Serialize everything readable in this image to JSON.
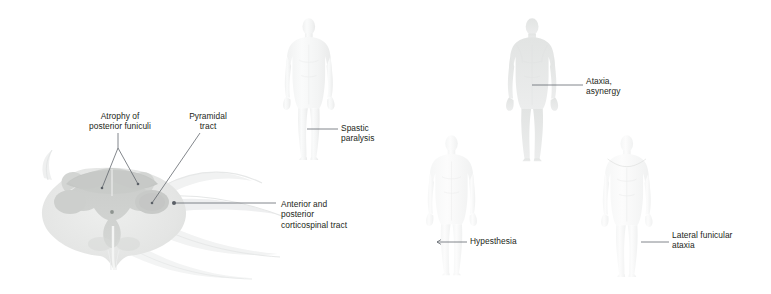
{
  "figure": {
    "background_color": "#ffffff",
    "text_color": "#231f20",
    "leader_color": "#5a5f66"
  },
  "cord_diagram": {
    "name": "spinal-cord-cross-section",
    "colors": {
      "outer_white_matter": "#e3e4e3",
      "gray_matter": "#cfd1cf",
      "posterior_funiculi": "#c6c8c6",
      "lateral_funiculus_patch": "#c9cbc9",
      "swoosh": "#eceded",
      "central_canal": "#8e9490"
    },
    "labels": [
      {
        "id": "atrophy-posterior-funiculi",
        "text": "Atrophy of\nposterior funiculi",
        "align": "center",
        "x": 70,
        "y": 111,
        "width": 100
      },
      {
        "id": "pyramidal-tract",
        "text": "Pyramidal\ntract",
        "align": "center",
        "x": 174,
        "y": 111,
        "width": 68
      },
      {
        "id": "anterior-posterior-corticospinal-tract",
        "text": "Anterior and\nposterior\ncorticospinal tract",
        "align": "left",
        "x": 281,
        "y": 199,
        "width": 96
      }
    ]
  },
  "body_figures": [
    {
      "id": "figure-spastic-paralysis",
      "shading": "lower-limbs",
      "label": {
        "id": "spastic-paralysis",
        "text": "Spastic\nparalysis",
        "align": "left",
        "x": 341,
        "y": 123,
        "width": 62
      }
    },
    {
      "id": "figure-ataxia-asynergy",
      "shading": "whole-body-light",
      "label": {
        "id": "ataxia-asynergy",
        "text": "Ataxia,\nasynergy",
        "align": "left",
        "x": 586,
        "y": 76,
        "width": 62
      }
    },
    {
      "id": "figure-hypesthesia",
      "shading": "whole-body-very-light",
      "label": {
        "id": "hypesthesia",
        "text": "Hypesthesia",
        "align": "left",
        "x": 470,
        "y": 235,
        "width": 80
      }
    },
    {
      "id": "figure-lateral-funicular-ataxia",
      "shading": "below-shoulder-cape",
      "label": {
        "id": "lateral-funicular-ataxia",
        "text": "Lateral funicular\nataxia",
        "align": "left",
        "x": 672,
        "y": 235,
        "width": 92
      }
    }
  ]
}
